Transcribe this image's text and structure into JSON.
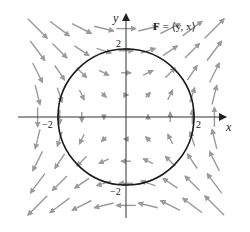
{
  "figure": {
    "field_label_bold": "F",
    "field_label_rest": " = ⟨y, x⟩",
    "field_expression": "F = ⟨y, x⟩",
    "axes": {
      "x_label": "x",
      "y_label": "y",
      "tick_labels": {
        "x_pos": "2",
        "x_neg": "−2",
        "y_pos": "2",
        "y_neg": "−2"
      },
      "range": [
        -2.6,
        2.6
      ]
    },
    "curve": {
      "type": "circle",
      "center": [
        0,
        0
      ],
      "radius": 2,
      "color": "#1a1a1a"
    },
    "vector_field": {
      "formula": "F(x,y) = (y, x)",
      "grid_min": -2.6,
      "grid_max": 2.6,
      "grid_step": 0.65,
      "arrow_scale_px_per_unit": 7.5,
      "color": "#9a9a9a"
    },
    "colors": {
      "axis": "#333333",
      "arrow": "#9a9a9a",
      "circle": "#1a1a1a"
    }
  }
}
